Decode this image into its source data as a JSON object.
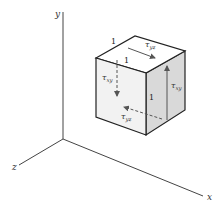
{
  "diagram": {
    "axes": {
      "x_label": "x",
      "y_label": "y",
      "z_label": "z"
    },
    "cube": {
      "edge_labels": [
        "1",
        "1",
        "1"
      ],
      "stresses": [
        {
          "id": "top",
          "symbol": "τ",
          "subscript": "yz",
          "direction": "toward +x",
          "face": "top"
        },
        {
          "id": "front",
          "symbol": "τ",
          "subscript": "xy",
          "direction": "down",
          "face": "hidden left",
          "dashed": true
        },
        {
          "id": "right",
          "symbol": "τ",
          "subscript": "xy",
          "direction": "up",
          "face": "right"
        },
        {
          "id": "bottom",
          "symbol": "τ",
          "subscript": "yz",
          "direction": "toward -x",
          "face": "hidden bottom",
          "dashed": true
        }
      ]
    },
    "colors": {
      "front_face": "#f2f2f2",
      "top_face": "#ffffff",
      "right_face": "#d9d9d9",
      "edge": "#222222",
      "arrow": "#555555"
    }
  }
}
